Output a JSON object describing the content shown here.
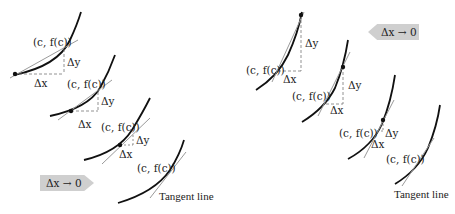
{
  "diagram": {
    "left_sequence": {
      "direction_label": "Δx → 0",
      "panels": [
        {
          "point_label": "(c, f(c))",
          "dy_label": "Δy",
          "dx_label": "Δx"
        },
        {
          "point_label": "(c, f(c))",
          "dy_label": "Δy",
          "dx_label": "Δx"
        },
        {
          "point_label": "(c, f(c))",
          "dy_label": "Δy",
          "dx_label": "Δx"
        },
        {
          "point_label": "(c, f(c))",
          "tangent_label": "Tangent line"
        }
      ]
    },
    "right_sequence": {
      "direction_label": "Δx → 0",
      "panels": [
        {
          "point_label": "(c, f(c))",
          "dy_label": "Δy",
          "dx_label": "Δx"
        },
        {
          "point_label": "(c, f(c))",
          "dy_label": "Δy",
          "dx_label": "Δx"
        },
        {
          "point_label": "(c, f(c))",
          "dy_label": "Δy",
          "dx_label": "Δx"
        },
        {
          "point_label": "(c, f(c))",
          "tangent_label": "Tangent line"
        }
      ]
    },
    "colors": {
      "curve": "#111111",
      "secant": "#9a9a9a",
      "dashed": "#777777",
      "arrow_fill": "#cfcfcf"
    }
  }
}
